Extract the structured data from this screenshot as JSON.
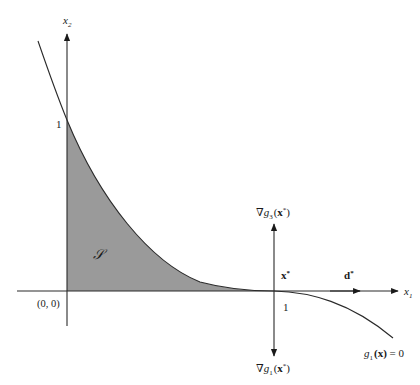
{
  "figure": {
    "axes": {
      "x1_label": "x",
      "x1_sub": "1",
      "x2_label": "x",
      "x2_sub": "2",
      "origin_label": "(0, 0)",
      "x2_tick_label": "1",
      "x1_tick_label": "1"
    },
    "region_label": "𝒮",
    "point_label": "x",
    "point_sup": "*",
    "direction_label": "d",
    "direction_sup": "*",
    "gradient_top": {
      "nabla": "∇",
      "g": "g",
      "sub": "3",
      "arg_open": "(",
      "arg_x": "x",
      "arg_sup": "*",
      "arg_close": ")"
    },
    "gradient_bottom": {
      "nabla": "∇",
      "g": "g",
      "sub": "1",
      "arg_open": "(",
      "arg_x": "x",
      "arg_sup": "*",
      "arg_close": ")"
    },
    "constraint_label": {
      "g": "g",
      "sub": "1",
      "arg": "(x)",
      "rhs": " = 0"
    },
    "colors": {
      "region_fill": "#9a9a9a",
      "line": "#2a2a2a"
    }
  }
}
